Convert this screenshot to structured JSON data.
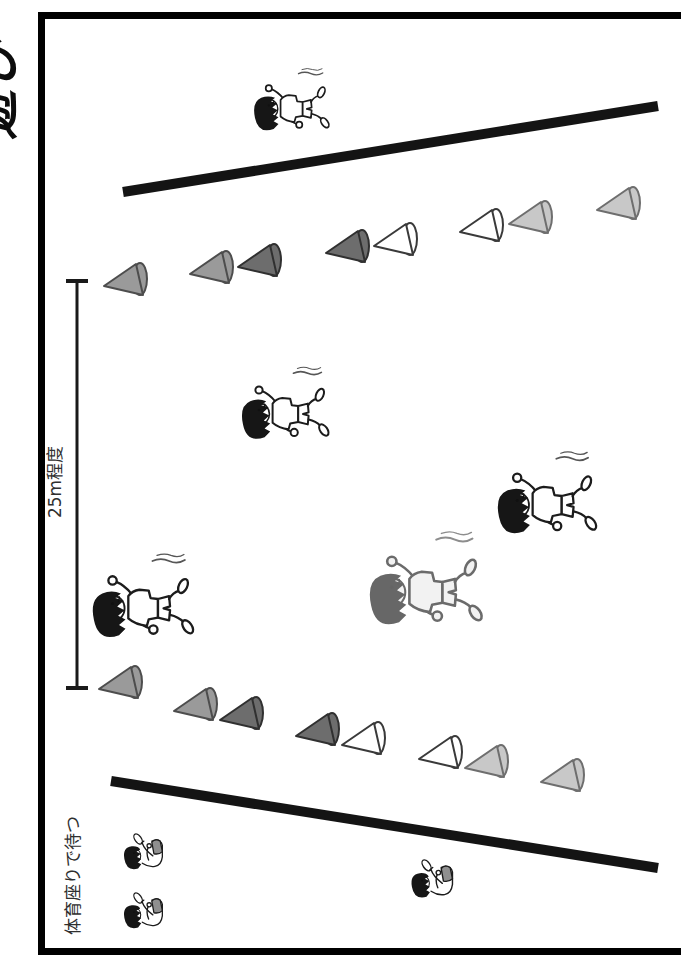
{
  "page": {
    "title_fragment": "遊び"
  },
  "labels": {
    "distance": "25m程度",
    "waiting": "体育座りで待つ"
  },
  "colors": {
    "frame": "#000000",
    "line": "#141414",
    "measure": "#1a1a1a",
    "text": "#2f2f2f",
    "cones": {
      "gray": {
        "fill": "#9a9a9a",
        "stroke": "#4d4d4d"
      },
      "dark": {
        "fill": "#6d6d6d",
        "stroke": "#303030"
      },
      "white": {
        "fill": "#ffffff",
        "stroke": "#3a3a3a"
      },
      "light": {
        "fill": "#c8c8c8",
        "stroke": "#6e6e6e"
      }
    }
  },
  "field": {
    "start_line": {
      "x1": 123,
      "y1": 192,
      "x2": 658,
      "y2": 106,
      "width": 10
    },
    "finish_line": {
      "x1": 111,
      "y1": 781,
      "x2": 658,
      "y2": 868,
      "width": 10
    },
    "measure_line": {
      "x": 77,
      "y1": 281,
      "y2": 688,
      "cap_half": 11
    }
  },
  "cones": {
    "top_row": [
      {
        "x": 100,
        "y": 261,
        "shade": "gray"
      },
      {
        "x": 186,
        "y": 249,
        "shade": "gray"
      },
      {
        "x": 234,
        "y": 242,
        "shade": "dark"
      },
      {
        "x": 322,
        "y": 228,
        "shade": "dark"
      },
      {
        "x": 370,
        "y": 221,
        "shade": "white"
      },
      {
        "x": 456,
        "y": 207,
        "shade": "white"
      },
      {
        "x": 505,
        "y": 199,
        "shade": "light"
      },
      {
        "x": 593,
        "y": 185,
        "shade": "light"
      }
    ],
    "bottom_row": [
      {
        "x": 95,
        "y": 664,
        "shade": "gray"
      },
      {
        "x": 170,
        "y": 686,
        "shade": "gray"
      },
      {
        "x": 216,
        "y": 695,
        "shade": "dark"
      },
      {
        "x": 292,
        "y": 711,
        "shade": "dark"
      },
      {
        "x": 338,
        "y": 720,
        "shade": "white"
      },
      {
        "x": 415,
        "y": 734,
        "shade": "white"
      },
      {
        "x": 461,
        "y": 743,
        "shade": "light"
      },
      {
        "x": 537,
        "y": 757,
        "shade": "light"
      }
    ]
  },
  "children": [
    {
      "name": "runner-top",
      "type": "runner",
      "x": 250,
      "y": 64,
      "w": 86,
      "h": 76,
      "sketch": false
    },
    {
      "name": "runner-upper",
      "type": "runner",
      "x": 238,
      "y": 362,
      "w": 98,
      "h": 88,
      "sketch": false
    },
    {
      "name": "runner-right",
      "type": "runner",
      "x": 492,
      "y": 446,
      "w": 114,
      "h": 100,
      "sketch": false
    },
    {
      "name": "runner-left",
      "type": "runner",
      "x": 88,
      "y": 548,
      "w": 114,
      "h": 102,
      "sketch": false
    },
    {
      "name": "runner-center",
      "type": "runner",
      "x": 366,
      "y": 524,
      "w": 124,
      "h": 116,
      "sketch": true
    },
    {
      "name": "sitter-1",
      "type": "sitter",
      "x": 102,
      "y": 820,
      "w": 88,
      "h": 58,
      "sketch": false
    },
    {
      "name": "sitter-2",
      "type": "sitter",
      "x": 102,
      "y": 879,
      "w": 88,
      "h": 58,
      "sketch": false
    },
    {
      "name": "sitter-3",
      "type": "sitter",
      "x": 396,
      "y": 845,
      "w": 78,
      "h": 62,
      "sketch": false
    }
  ]
}
